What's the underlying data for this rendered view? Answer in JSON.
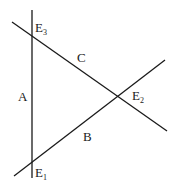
{
  "diagram": {
    "type": "triangle-of-three-intersecting-lines",
    "colors": {
      "stroke": "#1a1a1a",
      "background": "#ffffff"
    },
    "lines": [
      {
        "id": "A",
        "label": "A",
        "x1": 32,
        "y1": 10,
        "x2": 32,
        "y2": 178,
        "label_x": 18,
        "label_y": 101
      },
      {
        "id": "B",
        "label": "B",
        "x1": 14,
        "y1": 176,
        "x2": 165,
        "y2": 60,
        "label_x": 83,
        "label_y": 141
      },
      {
        "id": "C",
        "label": "C",
        "x1": 12,
        "y1": 22,
        "x2": 167,
        "y2": 131,
        "label_x": 77,
        "label_y": 62
      }
    ],
    "intersections": [
      {
        "id": "E1",
        "base": "E",
        "sub": "1",
        "x": 32,
        "y": 163,
        "label_x": 35,
        "label_y": 177
      },
      {
        "id": "E2",
        "base": "E",
        "sub": "2",
        "x": 118,
        "y": 96,
        "label_x": 132,
        "label_y": 100
      },
      {
        "id": "E3",
        "base": "E",
        "sub": "3",
        "x": 32,
        "y": 34,
        "label_x": 35,
        "label_y": 32
      }
    ]
  }
}
